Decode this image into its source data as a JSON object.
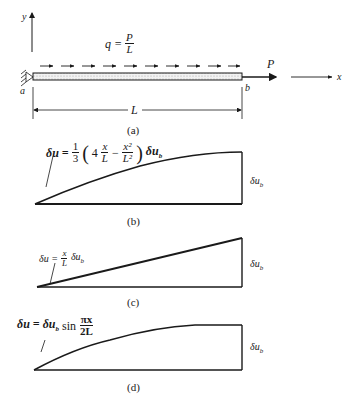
{
  "figure": {
    "panel_a": {
      "caption": "(a)",
      "y_axis_label": "y",
      "x_axis_label": "x",
      "load_label": "q =",
      "load_num": "P",
      "load_den": "L",
      "force_label": "P",
      "end_a_label": "a",
      "end_b_label": "b",
      "length_label": "L"
    },
    "panel_b": {
      "caption": "(b)",
      "formula_lhs": "δu =",
      "formula_coef_num": "1",
      "formula_coef_den": "3",
      "formula_open": "(",
      "formula_four": "4",
      "term1_num": "x",
      "term1_den": "L",
      "minus": "−",
      "term2_num": "x²",
      "term2_den": "L²",
      "formula_close": ")",
      "formula_tail": "δu",
      "formula_tail_sub": "b",
      "end_label": "δu",
      "end_label_sub": "b"
    },
    "panel_c": {
      "caption": "(c)",
      "formula_lhs": "δu =",
      "frac_num": "x",
      "frac_den": "L",
      "formula_tail": "δu",
      "formula_tail_sub": "b",
      "end_label": "δu",
      "end_label_sub": "b"
    },
    "panel_d": {
      "caption": "(d)",
      "formula_lhs": "δu = δu",
      "formula_lhs_sub": "b",
      "formula_sin": "sin",
      "frac_num": "πx",
      "frac_den": "2L",
      "end_label": "δu",
      "end_label_sub": "b"
    }
  }
}
